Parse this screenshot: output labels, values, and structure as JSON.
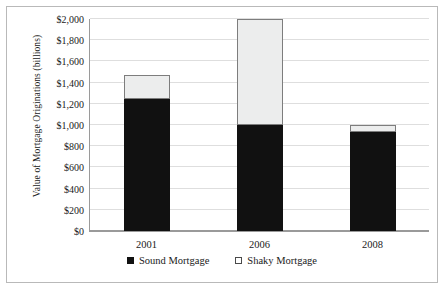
{
  "chart_data": {
    "type": "bar",
    "stacked": true,
    "title": "",
    "xlabel": "",
    "ylabel": "Value of Mortgage Originations (billions)",
    "categories": [
      "2001",
      "2006",
      "2008"
    ],
    "series": [
      {
        "name": "Sound Mortgage",
        "values": [
          1250,
          1000,
          930
        ],
        "color": "#111111"
      },
      {
        "name": "Shaky Mortgage",
        "values": [
          220,
          1000,
          70
        ],
        "color": "#eceded"
      }
    ],
    "totals": [
      1470,
      2000,
      1000
    ],
    "ylim": [
      0,
      2000
    ],
    "ytick_step": 200,
    "ytick_labels": [
      "$2,000",
      "$1,800",
      "$1,600",
      "$1,400",
      "$1,200",
      "$1,000",
      "$800",
      "$600",
      "$400",
      "$200",
      "$0"
    ],
    "ytick_values": [
      2000,
      1800,
      1600,
      1400,
      1200,
      1000,
      800,
      600,
      400,
      200,
      0
    ],
    "grid": true,
    "legend_position": "bottom",
    "legend": [
      {
        "label": "Sound Mortgage",
        "marker": "filled-square"
      },
      {
        "label": "Shaky Mortgage",
        "marker": "open-square"
      }
    ],
    "colors": {
      "sound": "#111111",
      "shaky": "#eceded",
      "gridline": "#dedede",
      "axis": "#9a9a9a",
      "border": "#b9b9b9"
    }
  }
}
